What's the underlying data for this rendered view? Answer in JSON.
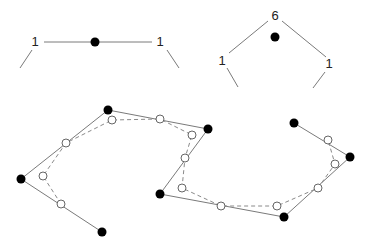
{
  "figure": {
    "colors": {
      "line": "#7a7a7a",
      "dashed": "#8a8a8a",
      "filled_point": "#000000",
      "open_point_fill": "#ffffff",
      "open_point_stroke": "#666666",
      "text": "#222222"
    },
    "top_left": {
      "labels": [
        {
          "text": "1",
          "x": 35,
          "y": 46
        },
        {
          "text": "1",
          "x": 160,
          "y": 46
        }
      ],
      "center_point": {
        "x": 95,
        "y": 42
      }
    },
    "top_right": {
      "labels": [
        {
          "text": "6",
          "x": 275,
          "y": 20
        },
        {
          "text": "1",
          "x": 222,
          "y": 65
        },
        {
          "text": "1",
          "x": 329,
          "y": 68
        }
      ],
      "center_point": {
        "x": 275,
        "y": 37
      }
    },
    "bottom": {
      "control_polygon": [
        [
          102,
          232
        ],
        [
          21,
          179
        ],
        [
          108,
          110
        ],
        [
          208,
          129
        ],
        [
          160,
          194
        ],
        [
          284,
          217
        ],
        [
          350,
          157
        ],
        [
          294,
          123
        ]
      ],
      "refined_curve": [
        [
          61,
          204
        ],
        [
          43,
          176
        ],
        [
          66,
          143
        ],
        [
          112,
          120
        ],
        [
          160,
          119
        ],
        [
          192,
          135
        ],
        [
          185,
          158
        ],
        [
          182,
          188
        ],
        [
          221,
          206
        ],
        [
          277,
          206
        ],
        [
          318,
          188
        ],
        [
          335,
          164
        ],
        [
          328,
          140
        ]
      ]
    }
  }
}
